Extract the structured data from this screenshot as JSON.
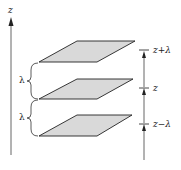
{
  "diagram": {
    "axis_label": "z",
    "lambda_label_upper": "λ",
    "lambda_label_lower": "λ",
    "level_labels": [
      "z+λ",
      "z",
      "z−λ"
    ],
    "colors": {
      "plane_fill": "#d9d9d9",
      "plane_stroke": "#222222",
      "line": "#555555"
    }
  }
}
